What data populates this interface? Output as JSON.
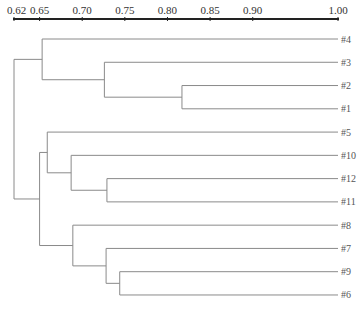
{
  "chart_data": {
    "type": "dendrogram",
    "title": "",
    "xlabel": "",
    "axis": {
      "position": "top",
      "range": [
        0.62,
        1.0
      ],
      "ticks": [
        {
          "value": 0.62,
          "label": "0.62"
        },
        {
          "value": 0.65,
          "label": "0.65"
        },
        {
          "value": 0.7,
          "label": "0.70"
        },
        {
          "value": 0.75,
          "label": "0.75"
        },
        {
          "value": 0.8,
          "label": "0.80"
        },
        {
          "value": 0.85,
          "label": "0.85"
        },
        {
          "value": 0.9,
          "label": "0.90"
        },
        {
          "value": 1.0,
          "label": "1.00"
        }
      ]
    },
    "leaves": [
      "#4",
      "#3",
      "#2",
      "#1",
      "#5",
      "#10",
      "#12",
      "#11",
      "#8",
      "#7",
      "#9",
      "#6"
    ],
    "merges": [
      {
        "id": "n21",
        "children": [
          "#2",
          "#1"
        ],
        "similarity": 0.817
      },
      {
        "id": "n3_21",
        "children": [
          "#3",
          "n21"
        ],
        "similarity": 0.726
      },
      {
        "id": "nA",
        "children": [
          "#4",
          "n3_21"
        ],
        "similarity": 0.653
      },
      {
        "id": "n1211",
        "children": [
          "#12",
          "#11"
        ],
        "similarity": 0.729
      },
      {
        "id": "n10_1211",
        "children": [
          "#10",
          "n1211"
        ],
        "similarity": 0.687
      },
      {
        "id": "n5_10",
        "children": [
          "#5",
          "n10_1211"
        ],
        "similarity": 0.659
      },
      {
        "id": "n96",
        "children": [
          "#9",
          "#6"
        ],
        "similarity": 0.744
      },
      {
        "id": "n7_96",
        "children": [
          "#7",
          "n96"
        ],
        "similarity": 0.728
      },
      {
        "id": "n8_7",
        "children": [
          "#8",
          "n7_96"
        ],
        "similarity": 0.689
      },
      {
        "id": "nB",
        "children": [
          "n5_10",
          "n8_7"
        ],
        "similarity": 0.65
      },
      {
        "id": "root",
        "children": [
          "nA",
          "nB"
        ],
        "similarity": 0.62
      }
    ],
    "colors": {
      "axis": "#222222",
      "branch": "#8a8a8a",
      "text": "#444444"
    }
  }
}
